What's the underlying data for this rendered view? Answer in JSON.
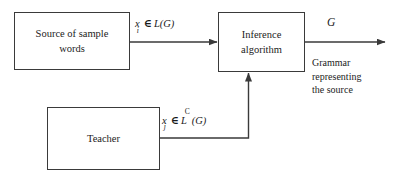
{
  "diagram": {
    "background_color": "#ffffff",
    "line_color": "#3a3a3a",
    "text_color": "#1a1a1a",
    "boxes": [
      {
        "id": "source",
        "label_line1": "Source of sample",
        "label_line2": "words"
      },
      {
        "id": "inference",
        "label_line1": "Inference",
        "label_line2": "algorithm"
      },
      {
        "id": "teacher",
        "label_line1": "Teacher",
        "label_line2": ""
      }
    ],
    "labels": {
      "positive_samples": {
        "var": "x",
        "subscript": "i",
        "relation": "∈",
        "set": "L(G)"
      },
      "negative_samples": {
        "var": "x",
        "subscript": "j",
        "relation": "∈",
        "set_base": "L",
        "set_superscript": "C",
        "set_arg": "(G)"
      },
      "output_symbol": "G",
      "output_caption_line1": "Grammar",
      "output_caption_line2": "representing",
      "output_caption_line3": "the source"
    },
    "arrows": [
      {
        "id": "source-to-inference",
        "from": "source",
        "to": "inference",
        "direction": "right"
      },
      {
        "id": "inference-to-output",
        "from": "inference",
        "to": "output",
        "direction": "right"
      },
      {
        "id": "teacher-to-inference",
        "from": "teacher",
        "to": "inference",
        "direction": "up"
      }
    ]
  }
}
